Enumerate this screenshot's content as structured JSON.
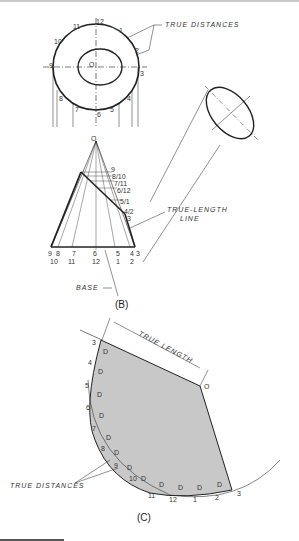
{
  "figure_b": {
    "caption": "(B)",
    "labels": {
      "true_distances": "TRUE DISTANCES",
      "true_length_line_1": "TRUE-LENGTH",
      "true_length_line_2": "LINE",
      "base": "BASE",
      "apex": "O",
      "center": "O"
    },
    "circle_points": [
      "12",
      "1",
      "2",
      "3",
      "4",
      "5",
      "6",
      "7",
      "8",
      "9",
      "10",
      "11"
    ],
    "cone_side_labels": [
      "9",
      "8/10",
      "7/11",
      "6/12",
      "5/1",
      "4/2",
      "3"
    ],
    "base_labels_top": [
      "9",
      "8",
      "7",
      "6",
      "5",
      "4",
      "3"
    ],
    "base_labels_bottom": [
      "10",
      "11",
      "12",
      "1",
      "2"
    ]
  },
  "figure_c": {
    "caption": "(C)",
    "labels": {
      "true_length": "TRUE LENGTH",
      "true_distances": "TRUE DISTANCES",
      "apex": "O",
      "segment": "D"
    },
    "arc_points": [
      "3",
      "4",
      "5",
      "6",
      "7",
      "8",
      "9",
      "10",
      "11",
      "12",
      "1",
      "2",
      "3"
    ],
    "fill_color": "#c8c8c8"
  }
}
